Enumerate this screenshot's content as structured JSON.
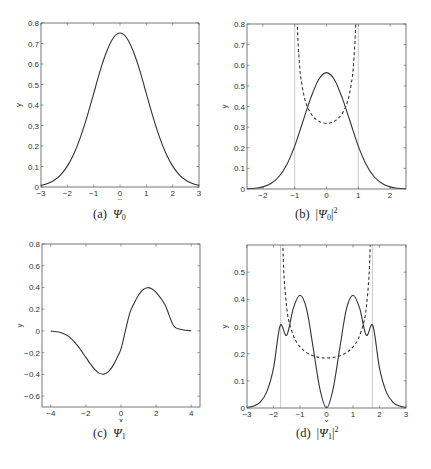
{
  "figure": {
    "panels": [
      {
        "id": "a",
        "caption_label": "(a)",
        "caption_sym": "Ψ",
        "caption_sub": "0",
        "caption_pre": "",
        "caption_post": "",
        "caption_sup": ""
      },
      {
        "id": "b",
        "caption_label": "(b)",
        "caption_sym": "Ψ",
        "caption_sub": "0",
        "caption_pre": "|",
        "caption_post": "|",
        "caption_sup": "2"
      },
      {
        "id": "c",
        "caption_label": "(c)",
        "caption_sym": "Ψ",
        "caption_sub": "1",
        "caption_pre": "",
        "caption_post": "",
        "caption_sup": ""
      },
      {
        "id": "d",
        "caption_label": "(d)",
        "caption_sym": "Ψ",
        "caption_sub": "1",
        "caption_pre": "|",
        "caption_post": "|",
        "caption_sup": "2"
      }
    ]
  },
  "chart_data": [
    {
      "id": "a",
      "type": "line",
      "title": "(a) Ψ0",
      "xlabel": "x",
      "ylabel": "y",
      "xlim": [
        -3,
        3
      ],
      "ylim": [
        0,
        0.8
      ],
      "xticks": [
        -3,
        -2,
        -1,
        0,
        1,
        2,
        3
      ],
      "yticks": [
        0,
        0.1,
        0.2,
        0.3,
        0.4,
        0.5,
        0.6,
        0.7,
        0.8
      ],
      "grid": false,
      "series": [
        {
          "name": "Psi0",
          "style": "solid",
          "x": [
            -3,
            -2.75,
            -2.5,
            -2.25,
            -2,
            -1.75,
            -1.5,
            -1.25,
            -1,
            -0.75,
            -0.5,
            -0.25,
            0,
            0.25,
            0.5,
            0.75,
            1,
            1.25,
            1.5,
            1.75,
            2,
            2.25,
            2.5,
            2.75,
            3
          ],
          "y": [
            0.0084,
            0.0172,
            0.0331,
            0.0596,
            0.1017,
            0.1623,
            0.2436,
            0.3433,
            0.4556,
            0.5688,
            0.6631,
            0.7281,
            0.7511,
            0.7281,
            0.6631,
            0.5688,
            0.4556,
            0.3433,
            0.2436,
            0.1623,
            0.1017,
            0.0596,
            0.0331,
            0.0172,
            0.0084
          ]
        }
      ]
    },
    {
      "id": "b",
      "type": "line",
      "title": "(b) |Ψ0|^2",
      "xlabel": "x",
      "ylabel": "y",
      "xlim": [
        -2.5,
        2.5
      ],
      "ylim": [
        0,
        0.8
      ],
      "xticks": [
        -2,
        -1,
        0,
        1,
        2
      ],
      "yticks": [
        0,
        0.1,
        0.2,
        0.3,
        0.4,
        0.5,
        0.6,
        0.7,
        0.8
      ],
      "grid": false,
      "vlines": [
        -1,
        1
      ],
      "series": [
        {
          "name": "|Psi0|^2",
          "style": "solid",
          "x": [
            -2.5,
            -2.25,
            -2,
            -1.75,
            -1.5,
            -1.25,
            -1,
            -0.75,
            -0.5,
            -0.25,
            0,
            0.25,
            0.5,
            0.75,
            1,
            1.25,
            1.5,
            1.75,
            2,
            2.25,
            2.5
          ],
          "y": [
            0.0011,
            0.0036,
            0.0103,
            0.0263,
            0.0593,
            0.1179,
            0.2076,
            0.3235,
            0.4394,
            0.5301,
            0.5642,
            0.5301,
            0.4394,
            0.3235,
            0.2076,
            0.1179,
            0.0593,
            0.0263,
            0.0103,
            0.0036,
            0.0011
          ]
        },
        {
          "name": "classical density",
          "style": "dashed",
          "x": [
            -0.92,
            -0.9,
            -0.85,
            -0.8,
            -0.7,
            -0.6,
            -0.5,
            -0.4,
            -0.3,
            -0.2,
            -0.1,
            0,
            0.1,
            0.2,
            0.3,
            0.4,
            0.5,
            0.6,
            0.7,
            0.8,
            0.85,
            0.9,
            0.92
          ],
          "y": [
            0.812,
            0.73,
            0.604,
            0.531,
            0.446,
            0.398,
            0.368,
            0.347,
            0.334,
            0.325,
            0.32,
            0.318,
            0.32,
            0.325,
            0.334,
            0.347,
            0.368,
            0.398,
            0.446,
            0.531,
            0.604,
            0.73,
            0.812
          ]
        }
      ]
    },
    {
      "id": "c",
      "type": "line",
      "title": "(c) Ψ1",
      "xlabel": "x",
      "ylabel": "y",
      "xlim": [
        -4.5,
        4.5
      ],
      "ylim": [
        -0.7,
        0.8
      ],
      "xticks": [
        -4,
        -2,
        0,
        2,
        4
      ],
      "yticks": [
        -0.6,
        -0.4,
        -0.2,
        0,
        0.2,
        0.4,
        0.6,
        0.8
      ],
      "grid": false,
      "series": [
        {
          "name": "Psi1",
          "style": "solid",
          "x": [
            -4,
            -3.5,
            -3,
            -2.5,
            -2,
            -1.75,
            -1.5,
            -1.25,
            -1,
            -0.75,
            -0.5,
            -0.25,
            0,
            0.25,
            0.5,
            0.75,
            1,
            1.25,
            1.5,
            1.75,
            2,
            2.5,
            3,
            3.5,
            4
          ],
          "y": [
            -0.0019,
            -0.0116,
            -0.0474,
            -0.1303,
            -0.2433,
            -0.3018,
            -0.3546,
            -0.3882,
            -0.3979,
            -0.3793,
            -0.3303,
            -0.2552,
            -0.1644,
            0,
            0.1644,
            0.2552,
            0.3303,
            0.3793,
            0.3979,
            0.3882,
            0.3546,
            0.2433,
            0.0474,
            0.0116,
            0.0019
          ]
        }
      ]
    },
    {
      "id": "d",
      "type": "line",
      "title": "(d) |Ψ1|^2",
      "xlabel": "x",
      "ylabel": "y",
      "xlim": [
        -3,
        3
      ],
      "ylim": [
        0,
        0.6
      ],
      "xticks": [
        -3,
        -2,
        -1,
        0,
        1,
        2,
        3
      ],
      "yticks": [
        0,
        0.1,
        0.2,
        0.3,
        0.4,
        0.5
      ],
      "grid": false,
      "vlines": [
        -1.732,
        1.732
      ],
      "series": [
        {
          "name": "|Psi1|^2",
          "style": "solid",
          "x": [
            -3,
            -2.75,
            -2.5,
            -2.25,
            -2,
            -1.75,
            -1.5,
            -1.25,
            -1,
            -0.75,
            -0.5,
            -0.25,
            0,
            0.25,
            0.5,
            0.75,
            1,
            1.25,
            1.5,
            1.75,
            2,
            2.25,
            2.5,
            2.75,
            3
          ],
          "y": [
            0.002,
            0.0071,
            0.022,
            0.0602,
            0.1464,
            0.3029,
            0.2679,
            0.3678,
            0.4151,
            0.3641,
            0.2197,
            0.0705,
            0,
            0.0705,
            0.2197,
            0.3641,
            0.4151,
            0.3678,
            0.2679,
            0.3029,
            0.1464,
            0.0602,
            0.022,
            0.0071,
            0.002
          ]
        },
        {
          "name": "classical density",
          "style": "dashed",
          "x": [
            -1.67,
            -1.65,
            -1.6,
            -1.5,
            -1.4,
            -1.2,
            -1,
            -0.8,
            -0.6,
            -0.4,
            -0.2,
            0,
            0.2,
            0.4,
            0.6,
            0.8,
            1,
            1.2,
            1.4,
            1.5,
            1.6,
            1.65,
            1.67
          ],
          "y": [
            0.69,
            0.605,
            0.48,
            0.368,
            0.312,
            0.255,
            0.225,
            0.207,
            0.196,
            0.189,
            0.185,
            0.184,
            0.185,
            0.189,
            0.196,
            0.207,
            0.225,
            0.255,
            0.312,
            0.368,
            0.48,
            0.605,
            0.69
          ]
        }
      ]
    }
  ]
}
